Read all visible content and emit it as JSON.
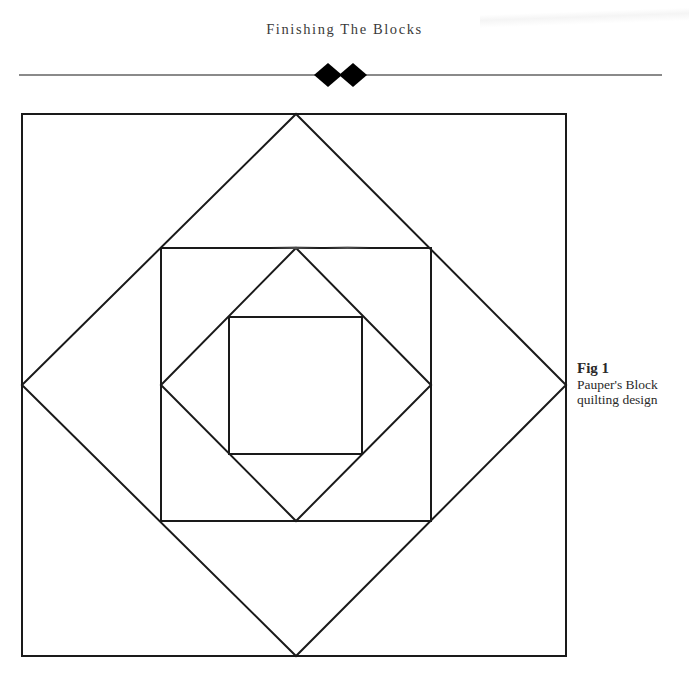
{
  "header": {
    "running_title": "Finishing The Blocks",
    "ornament": "double-diamond-ornament"
  },
  "figure": {
    "label": "Fig 1",
    "caption": "Pauper's Block quilting design",
    "caption_line1": "Pauper's Block",
    "caption_line2": "quilting design",
    "line_color": "#1a1a1a",
    "shapes": [
      "outer-square",
      "large-diamond",
      "middle-square",
      "small-diamond",
      "inner-square"
    ]
  }
}
